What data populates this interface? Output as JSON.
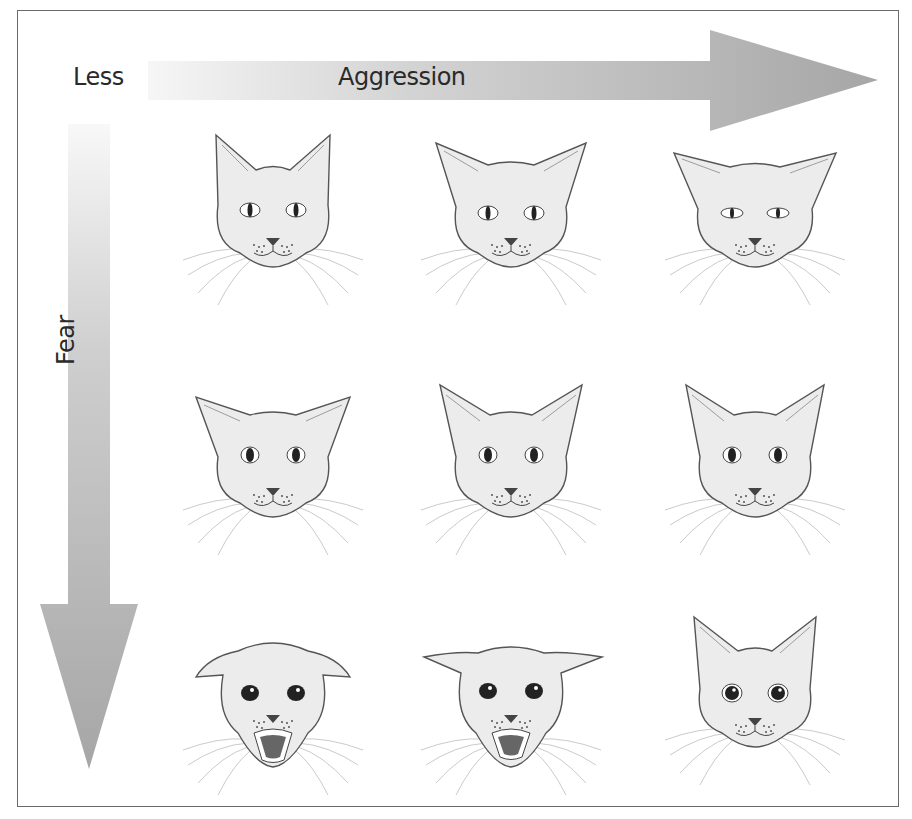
{
  "figure": {
    "axis_x": {
      "start_label": "Less",
      "label": "Aggression",
      "direction": "right"
    },
    "axis_y": {
      "label": "Fear",
      "direction": "down"
    },
    "colors": {
      "arrow_light": "#f4f4f4",
      "arrow_dark": "#a9a9a9",
      "border": "#6a6a6a",
      "face_fill": "#ececec",
      "line": "#555555"
    },
    "grid": {
      "rows": 3,
      "cols": 3,
      "cells": [
        {
          "row": 0,
          "col": 0,
          "ears": "upright",
          "eyes": "slit",
          "mouth": "closed"
        },
        {
          "row": 0,
          "col": 1,
          "ears": "slightly-sideways",
          "eyes": "slit",
          "mouth": "closed"
        },
        {
          "row": 0,
          "col": 2,
          "ears": "sideways",
          "eyes": "narrowed-slit",
          "mouth": "closed"
        },
        {
          "row": 1,
          "col": 0,
          "ears": "sideways",
          "eyes": "oval-pupil",
          "mouth": "closed"
        },
        {
          "row": 1,
          "col": 1,
          "ears": "upright-sideways",
          "eyes": "oval-pupil",
          "mouth": "closed"
        },
        {
          "row": 1,
          "col": 2,
          "ears": "upright-sideways",
          "eyes": "oval-pupil",
          "mouth": "closed"
        },
        {
          "row": 2,
          "col": 0,
          "ears": "flattened",
          "eyes": "dilated",
          "mouth": "open-hissing"
        },
        {
          "row": 2,
          "col": 1,
          "ears": "flattened-wide",
          "eyes": "dilated",
          "mouth": "open-hissing"
        },
        {
          "row": 2,
          "col": 2,
          "ears": "upright",
          "eyes": "dilated",
          "mouth": "closed"
        }
      ]
    }
  }
}
